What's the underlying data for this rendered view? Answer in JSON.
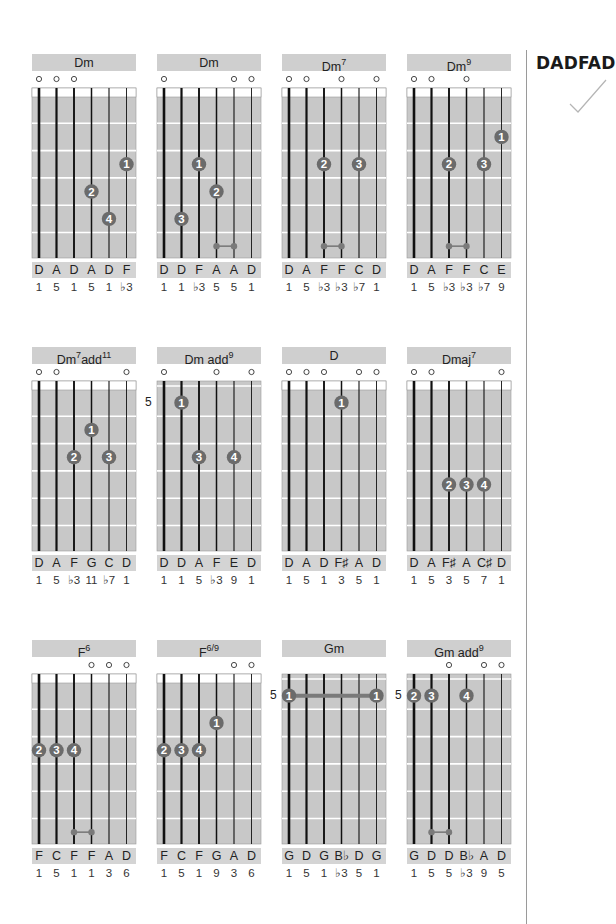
{
  "tuning": {
    "label": "DADFAD",
    "check_icon": "checkmark-icon"
  },
  "colors": {
    "board": "#c8c8c8",
    "title_bar": "#cfcfcf",
    "fret_line": "#ffffff",
    "finger": "#6b6b6b",
    "string": "#111111",
    "barre": "#7a7a7a"
  },
  "chords": [
    {
      "name": "Dm",
      "sup": "",
      "open": [
        "o",
        "o",
        "o",
        "",
        "",
        ""
      ],
      "start_fret": "",
      "fingers": [
        {
          "string": 6,
          "fret": 3,
          "label": "1"
        },
        {
          "string": 4,
          "fret": 4,
          "label": "2"
        },
        {
          "string": 5,
          "fret": 5,
          "label": "4"
        }
      ],
      "ties": [],
      "notes": [
        "D",
        "A",
        "D",
        "A",
        "D",
        "F"
      ],
      "intervals": [
        "1",
        "5",
        "1",
        "5",
        "1",
        "♭3"
      ]
    },
    {
      "name": "Dm",
      "sup": "",
      "open": [
        "o",
        "",
        "",
        "",
        "o",
        "o"
      ],
      "start_fret": "",
      "fingers": [
        {
          "string": 3,
          "fret": 3,
          "label": "1"
        },
        {
          "string": 4,
          "fret": 4,
          "label": "2"
        },
        {
          "string": 2,
          "fret": 5,
          "label": "3"
        }
      ],
      "ties": [
        {
          "from": 4,
          "to": 5,
          "fret": 6
        }
      ],
      "notes": [
        "D",
        "D",
        "F",
        "A",
        "A",
        "D"
      ],
      "intervals": [
        "1",
        "1",
        "♭3",
        "5",
        "5",
        "1"
      ]
    },
    {
      "name": "Dm",
      "sup": "7",
      "open": [
        "o",
        "o",
        "",
        "o",
        "",
        "o"
      ],
      "start_fret": "",
      "fingers": [
        {
          "string": 3,
          "fret": 3,
          "label": "2"
        },
        {
          "string": 5,
          "fret": 3,
          "label": "3"
        }
      ],
      "ties": [
        {
          "from": 3,
          "to": 4,
          "fret": 6
        }
      ],
      "notes": [
        "D",
        "A",
        "F",
        "F",
        "C",
        "D"
      ],
      "intervals": [
        "1",
        "5",
        "♭3",
        "♭3",
        "♭7",
        "1"
      ]
    },
    {
      "name": "Dm",
      "sup": "9",
      "open": [
        "o",
        "o",
        "",
        "o",
        "",
        ""
      ],
      "start_fret": "",
      "fingers": [
        {
          "string": 6,
          "fret": 2,
          "label": "1"
        },
        {
          "string": 3,
          "fret": 3,
          "label": "2"
        },
        {
          "string": 5,
          "fret": 3,
          "label": "3"
        }
      ],
      "ties": [
        {
          "from": 3,
          "to": 4,
          "fret": 6
        }
      ],
      "notes": [
        "D",
        "A",
        "F",
        "F",
        "C",
        "E"
      ],
      "intervals": [
        "1",
        "5",
        "♭3",
        "♭3",
        "♭7",
        "9"
      ]
    },
    {
      "name": "Dm",
      "sup": "7",
      "suffix": "add",
      "sup2": "11",
      "open": [
        "o",
        "o",
        "",
        "",
        "",
        "o"
      ],
      "start_fret": "",
      "fingers": [
        {
          "string": 4,
          "fret": 2,
          "label": "1"
        },
        {
          "string": 3,
          "fret": 3,
          "label": "2"
        },
        {
          "string": 5,
          "fret": 3,
          "label": "3"
        }
      ],
      "ties": [],
      "notes": [
        "D",
        "A",
        "F",
        "G",
        "C",
        "D"
      ],
      "intervals": [
        "1",
        "5",
        "♭3",
        "11",
        "♭7",
        "1"
      ]
    },
    {
      "name": "Dm add",
      "sup": "9",
      "open": [
        "o",
        "",
        "",
        "o",
        "",
        "o"
      ],
      "start_fret": "5",
      "fingers": [
        {
          "string": 2,
          "fret": 1,
          "label": "1"
        },
        {
          "string": 3,
          "fret": 3,
          "label": "3"
        },
        {
          "string": 5,
          "fret": 3,
          "label": "4"
        }
      ],
      "ties": [],
      "notes": [
        "D",
        "D",
        "A",
        "F",
        "E",
        "D"
      ],
      "intervals": [
        "1",
        "1",
        "5",
        "♭3",
        "9",
        "1"
      ]
    },
    {
      "name": "D",
      "sup": "",
      "open": [
        "o",
        "o",
        "o",
        "",
        "o",
        "o"
      ],
      "start_fret": "",
      "fingers": [
        {
          "string": 4,
          "fret": 1,
          "label": "1"
        }
      ],
      "ties": [],
      "notes": [
        "D",
        "A",
        "D",
        "F♯",
        "A",
        "D"
      ],
      "intervals": [
        "1",
        "5",
        "1",
        "3",
        "5",
        "1"
      ]
    },
    {
      "name": "Dmaj",
      "sup": "7",
      "open": [
        "o",
        "o",
        "",
        "",
        "",
        "o"
      ],
      "start_fret": "",
      "fingers": [
        {
          "string": 3,
          "fret": 4,
          "label": "2"
        },
        {
          "string": 4,
          "fret": 4,
          "label": "3"
        },
        {
          "string": 5,
          "fret": 4,
          "label": "4"
        }
      ],
      "ties": [],
      "notes": [
        "D",
        "A",
        "F♯",
        "A",
        "C♯",
        "D"
      ],
      "intervals": [
        "1",
        "5",
        "3",
        "5",
        "7",
        "1"
      ]
    },
    {
      "name": "F",
      "sup": "6",
      "open": [
        "",
        "",
        "",
        "o",
        "o",
        "o"
      ],
      "start_fret": "",
      "fingers": [
        {
          "string": 1,
          "fret": 3,
          "label": "2"
        },
        {
          "string": 2,
          "fret": 3,
          "label": "3"
        },
        {
          "string": 3,
          "fret": 3,
          "label": "4"
        }
      ],
      "ties": [
        {
          "from": 3,
          "to": 4,
          "fret": 6
        }
      ],
      "notes": [
        "F",
        "C",
        "F",
        "F",
        "A",
        "D"
      ],
      "intervals": [
        "1",
        "5",
        "1",
        "1",
        "3",
        "6"
      ]
    },
    {
      "name": "F",
      "sup": "6/9",
      "open": [
        "",
        "",
        "",
        "",
        "o",
        "o"
      ],
      "start_fret": "",
      "fingers": [
        {
          "string": 4,
          "fret": 2,
          "label": "1"
        },
        {
          "string": 1,
          "fret": 3,
          "label": "2"
        },
        {
          "string": 2,
          "fret": 3,
          "label": "3"
        },
        {
          "string": 3,
          "fret": 3,
          "label": "4"
        }
      ],
      "ties": [],
      "notes": [
        "F",
        "C",
        "F",
        "G",
        "A",
        "D"
      ],
      "intervals": [
        "1",
        "5",
        "1",
        "9",
        "3",
        "6"
      ]
    },
    {
      "name": "Gm",
      "sup": "",
      "open": [
        "",
        "",
        "",
        "",
        "",
        ""
      ],
      "start_fret": "5",
      "fingers": [
        {
          "string": 1,
          "fret": 1,
          "label": "1"
        },
        {
          "string": 6,
          "fret": 1,
          "label": "1"
        }
      ],
      "barre": {
        "from": 1,
        "to": 6,
        "fret": 1
      },
      "ties": [],
      "notes": [
        "G",
        "D",
        "G",
        "B♭",
        "D",
        "G"
      ],
      "intervals": [
        "1",
        "5",
        "1",
        "♭3",
        "5",
        "1"
      ]
    },
    {
      "name": "Gm add",
      "sup": "9",
      "open": [
        "",
        "",
        "o",
        "",
        "o",
        "o"
      ],
      "start_fret": "5",
      "fingers": [
        {
          "string": 1,
          "fret": 1,
          "label": "2"
        },
        {
          "string": 2,
          "fret": 1,
          "label": "3"
        },
        {
          "string": 4,
          "fret": 1,
          "label": "4"
        }
      ],
      "ties": [
        {
          "from": 2,
          "to": 3,
          "fret": 6
        }
      ],
      "notes": [
        "G",
        "D",
        "D",
        "B♭",
        "A",
        "D"
      ],
      "intervals": [
        "1",
        "5",
        "5",
        "♭3",
        "9",
        "5"
      ]
    }
  ]
}
